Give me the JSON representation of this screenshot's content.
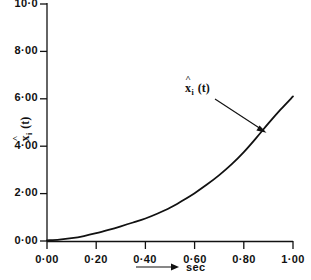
{
  "chart_data": {
    "type": "line",
    "title": "",
    "subtitle": "",
    "xlabel": "sec",
    "ylabel": "x̂ᵢ (t)",
    "xlim": [
      0.0,
      1.0
    ],
    "ylim": [
      0.0,
      10.0
    ],
    "grid": false,
    "legend": null,
    "x_tick_labels": [
      "0·00",
      "0·20",
      "0·40",
      "0·60",
      "0·80",
      "1·00"
    ],
    "x_tick_values": [
      0.0,
      0.2,
      0.4,
      0.6,
      0.8,
      1.0
    ],
    "y_tick_labels": [
      "0·00",
      "2·00",
      "4·00",
      "6·00",
      "8·00",
      "10·0"
    ],
    "y_tick_values": [
      0.0,
      2.0,
      4.0,
      6.0,
      8.0,
      10.0
    ],
    "annotations": [
      {
        "text": "x̂ᵢ (t)",
        "base": "x",
        "accent": "˄",
        "subscript": "i",
        "suffix": " (t)",
        "x": 0.62,
        "y": 6.5,
        "arrow_to_x": 0.9,
        "arrow_to_y": 4.55
      }
    ],
    "series": [
      {
        "name": "x̂ᵢ (t)",
        "color": "#111111",
        "line_width": 1.8,
        "x": [
          0.0,
          0.05,
          0.1,
          0.15,
          0.2,
          0.25,
          0.3,
          0.35,
          0.4,
          0.45,
          0.5,
          0.55,
          0.6,
          0.65,
          0.7,
          0.75,
          0.8,
          0.85,
          0.9,
          0.95,
          1.0
        ],
        "values": [
          0.03,
          0.06,
          0.12,
          0.21,
          0.33,
          0.47,
          0.62,
          0.78,
          0.95,
          1.16,
          1.4,
          1.7,
          2.02,
          2.38,
          2.78,
          3.23,
          3.75,
          4.34,
          4.96,
          5.55,
          6.1
        ]
      }
    ]
  },
  "axis_marker": {
    "x_axis_arrow": "arrow-right"
  }
}
